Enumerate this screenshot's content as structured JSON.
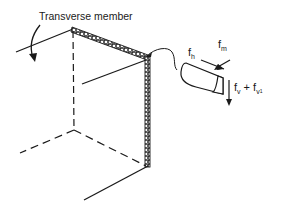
{
  "figure": {
    "title_label": "Transverse member",
    "labels": {
      "fh_main": "f",
      "fh_sub": "h",
      "fm_main": "f",
      "fm_sub": "m",
      "fv_main": "f",
      "fv_sub": "v",
      "plus": " + ",
      "fv1_main": "f",
      "fv1_sub": "v",
      "fv1_subsub": "1"
    },
    "colors": {
      "line": "#1a1a1a",
      "background": "#ffffff"
    }
  }
}
